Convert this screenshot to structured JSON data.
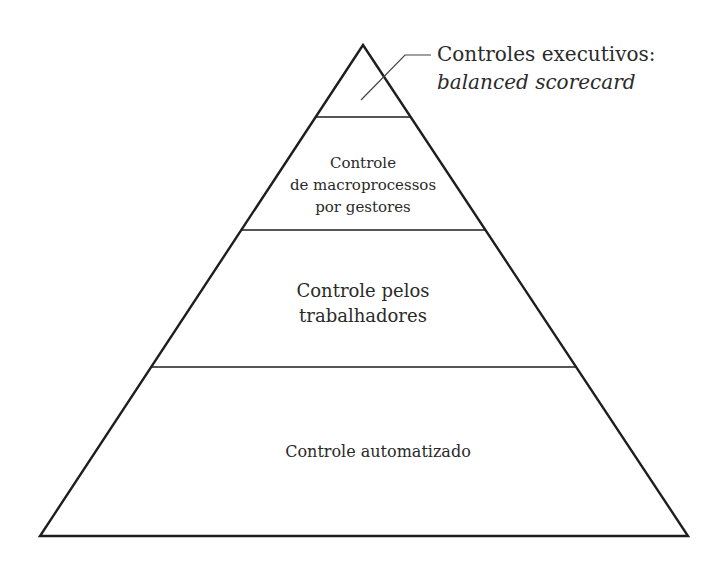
{
  "diagram": {
    "type": "pyramid",
    "stroke_color": "#1e1e1e",
    "text_color": "#2a2a2a",
    "callout": {
      "line1": "Controles executivos:",
      "line2": "balanced scorecard"
    },
    "levels": [
      {
        "lines": [
          "Controles executivos: balanced scorecard"
        ],
        "note": "top tier, labeled via callout"
      },
      {
        "lines": [
          "Controle",
          "de macroprocessos",
          "por gestores"
        ]
      },
      {
        "lines": [
          "Controle pelos",
          "trabalhadores"
        ]
      },
      {
        "lines": [
          "Controle automatizado"
        ]
      }
    ]
  }
}
